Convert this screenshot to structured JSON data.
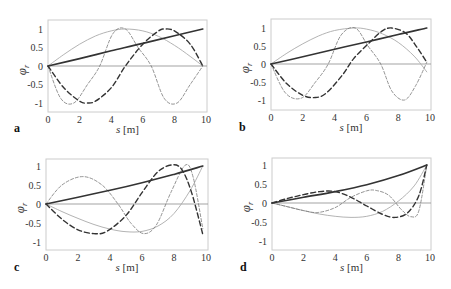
{
  "figure": {
    "xlabel": "s [m]",
    "ylabel": "φr",
    "xticks": [
      "0",
      "2",
      "4",
      "6",
      "8",
      "10"
    ],
    "yticks": [
      "1",
      "0.5",
      "0",
      "-0.5",
      "-1"
    ],
    "colors": {
      "frame": "#cccccc",
      "zero_line": "#999999",
      "mode_linear": "#333333",
      "mode_halfsine": "#aaaaaa",
      "mode_dashed_thick": "#333333",
      "mode_dashed_thin": "#777777"
    }
  },
  "chart_data": [
    {
      "type": "line",
      "panel": "a",
      "xlabel": "s [m]",
      "ylabel": "φr",
      "xlim": [
        0,
        10
      ],
      "ylim": [
        -1.2,
        1.2
      ],
      "series": [
        {
          "name": "mode-1 (solid thick)",
          "x": [
            0,
            2,
            4,
            6,
            8,
            9.8
          ],
          "y": [
            0,
            0.2,
            0.41,
            0.61,
            0.82,
            1.0
          ]
        },
        {
          "name": "mode-2 (solid light)",
          "x": [
            0,
            1,
            2,
            3,
            4,
            4.9,
            6,
            7,
            8,
            9,
            9.8
          ],
          "y": [
            0,
            0.31,
            0.59,
            0.81,
            0.95,
            1.0,
            0.95,
            0.8,
            0.56,
            0.26,
            0
          ]
        },
        {
          "name": "mode-3 (long dash thick)",
          "x": [
            0,
            1,
            2,
            2.45,
            3,
            4,
            4.9,
            6,
            7,
            7.35,
            8,
            9,
            9.8
          ],
          "y": [
            0,
            -0.59,
            -0.95,
            -1.0,
            -0.95,
            -0.59,
            0,
            0.59,
            0.95,
            1.0,
            0.95,
            0.59,
            0
          ]
        },
        {
          "name": "mode-4 (short dash thin)",
          "x": [
            0,
            0.8,
            1.63,
            2.5,
            3.27,
            4.1,
            4.9,
            5.7,
            6.53,
            7.35,
            8.17,
            9,
            9.8
          ],
          "y": [
            0,
            -0.87,
            -1.0,
            -0.5,
            0,
            0.87,
            1.0,
            0.5,
            0,
            -0.87,
            -1.0,
            -0.5,
            0
          ]
        }
      ]
    },
    {
      "type": "line",
      "panel": "b",
      "xlabel": "s [m]",
      "ylabel": "φr",
      "xlim": [
        0,
        10
      ],
      "ylim": [
        -1.2,
        1.2
      ],
      "series": [
        {
          "name": "mode-1 (solid thick)",
          "x": [
            0,
            2,
            4,
            6,
            8,
            9.8
          ],
          "y": [
            0,
            0.2,
            0.41,
            0.61,
            0.82,
            1.0
          ]
        },
        {
          "name": "mode-2 (solid light)",
          "x": [
            0,
            1,
            2,
            3,
            4,
            5.2,
            6,
            7,
            8,
            9,
            9.8
          ],
          "y": [
            0,
            0.3,
            0.56,
            0.78,
            0.93,
            1.0,
            0.97,
            0.84,
            0.6,
            0.22,
            -0.22
          ]
        },
        {
          "name": "mode-3 (long dash thick)",
          "x": [
            0,
            1,
            2,
            2.8,
            3.5,
            4.5,
            5.2,
            6.2,
            7,
            7.6,
            8.5,
            9.2,
            9.8
          ],
          "y": [
            0,
            -0.55,
            -0.87,
            -0.93,
            -0.8,
            -0.3,
            0.15,
            0.6,
            0.92,
            1.0,
            0.85,
            0.45,
            0.05
          ]
        },
        {
          "name": "mode-4 (short dash thin)",
          "x": [
            0,
            0.9,
            1.9,
            2.8,
            3.6,
            4.4,
            5.3,
            6.1,
            6.9,
            7.6,
            8.4,
            9.1,
            9.8
          ],
          "y": [
            0,
            -0.8,
            -0.95,
            -0.5,
            0,
            0.8,
            1.0,
            0.5,
            0,
            -0.75,
            -1.0,
            -0.6,
            0.05
          ]
        }
      ]
    },
    {
      "type": "line",
      "panel": "c",
      "xlabel": "s [m]",
      "ylabel": "φr",
      "xlim": [
        0,
        10
      ],
      "ylim": [
        -1.2,
        1.2
      ],
      "series": [
        {
          "name": "mode-1 (solid thick)",
          "x": [
            0,
            2,
            4,
            6,
            8,
            9.8
          ],
          "y": [
            0,
            0.18,
            0.36,
            0.56,
            0.78,
            1.0
          ]
        },
        {
          "name": "mode-2 (solid light)",
          "x": [
            0,
            1,
            2,
            3,
            4,
            5,
            6,
            7,
            8,
            9,
            9.8
          ],
          "y": [
            0,
            -0.2,
            -0.38,
            -0.54,
            -0.66,
            -0.73,
            -0.72,
            -0.58,
            -0.25,
            0.35,
            1.0
          ]
        },
        {
          "name": "mode-3 (long dash thick)",
          "x": [
            0,
            1,
            2,
            3,
            3.8,
            5,
            6,
            7,
            7.9,
            8.5,
            9.1,
            9.8
          ],
          "y": [
            0,
            -0.4,
            -0.68,
            -0.78,
            -0.72,
            -0.3,
            0.3,
            0.85,
            1.03,
            0.9,
            0.3,
            -0.8
          ]
        },
        {
          "name": "mode-4 (short dash thin)",
          "x": [
            0,
            1,
            2.3,
            3.5,
            4.5,
            5.3,
            6.1,
            6.9,
            7.8,
            8.7,
            9.2,
            9.8
          ],
          "y": [
            0,
            0.5,
            0.72,
            0.5,
            0.0,
            -0.5,
            -0.78,
            -0.55,
            0.3,
            1.02,
            0.7,
            -0.65
          ]
        }
      ]
    },
    {
      "type": "line",
      "panel": "d",
      "xlabel": "s [m]",
      "ylabel": "φr",
      "xlim": [
        0,
        10
      ],
      "ylim": [
        -1.2,
        1.2
      ],
      "series": [
        {
          "name": "mode-1 (solid thick)",
          "x": [
            0,
            2,
            4,
            6,
            8,
            9.8
          ],
          "y": [
            0,
            0.15,
            0.3,
            0.48,
            0.72,
            1.0
          ]
        },
        {
          "name": "mode-2 (solid light)",
          "x": [
            0,
            1,
            2,
            3,
            4,
            5,
            6,
            7,
            8,
            9,
            9.8
          ],
          "y": [
            0,
            -0.1,
            -0.2,
            -0.29,
            -0.35,
            -0.38,
            -0.35,
            -0.22,
            0.05,
            0.45,
            1.0
          ]
        },
        {
          "name": "mode-3 (long dash thick)",
          "x": [
            0,
            1,
            2,
            3,
            4,
            5,
            6,
            7,
            7.8,
            8.6,
            9.3,
            9.8
          ],
          "y": [
            0,
            0.12,
            0.22,
            0.3,
            0.3,
            0.15,
            -0.08,
            -0.3,
            -0.38,
            -0.25,
            0.2,
            1.0
          ]
        },
        {
          "name": "mode-4 (short dash thin)",
          "x": [
            0,
            1,
            2,
            2.9,
            4,
            5,
            6,
            6.6,
            7.4,
            8.2,
            8.8,
            9.3,
            9.8
          ],
          "y": [
            0,
            -0.1,
            -0.2,
            -0.25,
            -0.12,
            0.15,
            0.32,
            0.33,
            0.2,
            -0.18,
            -0.36,
            -0.2,
            1.0
          ]
        }
      ]
    }
  ],
  "panels": [
    {
      "label": "a",
      "x0": 48,
      "x1": 207,
      "y0": 20,
      "y1": 112,
      "zx": 48,
      "zx10": 206,
      "zy": 66,
      "ypx": 37,
      "lx": 14,
      "ly": 132
    },
    {
      "label": "b",
      "x0": 271,
      "x1": 431,
      "y0": 19,
      "y1": 110,
      "zx": 271,
      "zx10": 430,
      "zy": 64,
      "ypx": 36,
      "lx": 239,
      "ly": 131
    },
    {
      "label": "c",
      "x0": 46,
      "x1": 208,
      "y0": 159,
      "y1": 250,
      "zx": 46,
      "zx10": 206,
      "zy": 204,
      "ypx": 38,
      "lx": 14,
      "ly": 271
    },
    {
      "label": "d",
      "x0": 272,
      "x1": 431,
      "y0": 158,
      "y1": 250,
      "zx": 272,
      "zx10": 430,
      "zy": 203,
      "ypx": 38,
      "lx": 240,
      "ly": 271
    }
  ]
}
